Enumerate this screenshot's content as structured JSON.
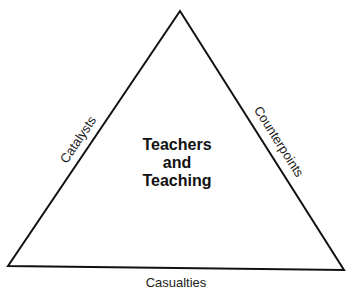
{
  "diagram": {
    "shape": "triangle",
    "center": {
      "lines": [
        "Teachers",
        "and",
        "Teaching"
      ]
    },
    "sides": {
      "left": "Catalysts",
      "right": "Counterpoints",
      "bottom": "Casualties"
    },
    "colors": {
      "stroke": "#111111",
      "background": "#ffffff"
    }
  }
}
